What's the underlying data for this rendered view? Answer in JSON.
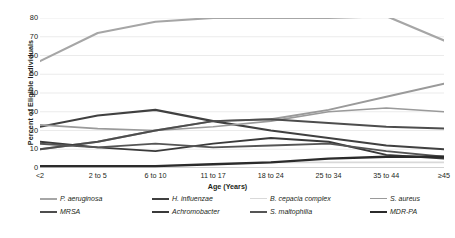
{
  "chart_data": {
    "type": "line",
    "title": "",
    "xlabel": "Age (Years)",
    "ylabel": "Percent of Eligible Individuals",
    "categories": [
      "<2",
      "2 to 5",
      "6 to 10",
      "11 to 17",
      "18 to 24",
      "25 to 34",
      "35 to 44",
      "≥45"
    ],
    "ylim": [
      0,
      80
    ],
    "yticks": [
      0,
      10,
      20,
      30,
      40,
      50,
      60,
      70,
      80
    ],
    "grid": true,
    "legend_position": "bottom",
    "series": [
      {
        "name": "P. aeruginosa",
        "color": "#a6a6a6",
        "width": 2.2,
        "values": [
          57,
          72,
          78,
          80,
          80,
          80,
          81,
          68
        ]
      },
      {
        "name": "H. influenzae",
        "color": "#404040",
        "width": 2.2,
        "values": [
          22,
          28,
          31,
          25,
          20,
          16,
          12,
          10
        ]
      },
      {
        "name": "B. cepacia complex",
        "color": "#d9d9d9",
        "width": 1.6,
        "values": [
          1,
          1,
          1,
          2,
          3,
          3,
          3,
          3
        ]
      },
      {
        "name": "S. aureus",
        "color": "#9a9a9a",
        "width": 1.6,
        "values": [
          23,
          21,
          20,
          22,
          25,
          30,
          32,
          30
        ]
      },
      {
        "name": "MRSA",
        "color": "#4d4d4d",
        "width": 2.0,
        "values": [
          10,
          14,
          20,
          25,
          26,
          24,
          22,
          21
        ]
      },
      {
        "name": "Achromobacter",
        "color": "#3a3a3a",
        "width": 2.0,
        "values": [
          14,
          11,
          9,
          13,
          16,
          14,
          7,
          5
        ]
      },
      {
        "name": "S. maltophilia",
        "color": "#555555",
        "width": 2.0,
        "values": [
          13,
          11,
          13,
          11,
          12,
          13,
          9,
          6
        ]
      },
      {
        "name": "MDR-PA",
        "color": "#2b2b2b",
        "width": 2.4,
        "values": [
          1,
          1,
          1,
          2,
          3,
          5,
          6,
          6
        ]
      }
    ],
    "extra_series": [
      {
        "name": "S. aureus rising",
        "color": "#9a9a9a",
        "width": 2.0,
        "values": [
          10,
          14,
          20,
          25,
          26,
          31,
          38,
          45
        ]
      }
    ]
  },
  "legend": {
    "row1": [
      "P. aeruginosa",
      "H. influenzae",
      "B. cepacia complex",
      "S. aureus"
    ],
    "row2": [
      "MRSA",
      "Achromobacter",
      "S. maltophilia",
      "MDR-PA"
    ]
  }
}
